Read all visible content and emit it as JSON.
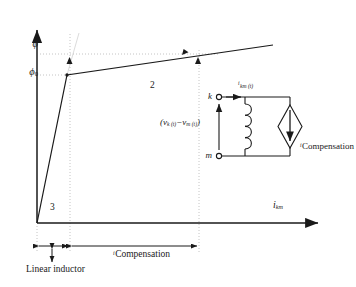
{
  "figure": {
    "type": "piecewise-linear-saturation-curve-with-equivalent-circuit",
    "axes": {
      "y_axis_name": "flux-linkage-axis",
      "x_axis_label": "i",
      "x_axis_label_sub": "km",
      "y_tick_labels": [
        {
          "name": "phi",
          "text": "ϕ",
          "sub": "",
          "y_px": 54
        },
        {
          "name": "phi-zero",
          "text": "ϕ",
          "sub": "0",
          "y_px": 75
        }
      ]
    },
    "curve": {
      "name": "saturation-characteristic",
      "knee_point_px": [
        67,
        75
      ],
      "origin_px": [
        37,
        223
      ],
      "end_px": [
        273,
        45
      ],
      "segments": [
        {
          "name": "steep-unsaturated-segment",
          "label": "3"
        },
        {
          "name": "shallow-saturated-segment",
          "label": "2"
        }
      ]
    },
    "region_labels": [
      {
        "name": "region-label-2",
        "text": "2"
      },
      {
        "name": "region-label-3",
        "text": "3"
      }
    ],
    "dimension_lines": [
      {
        "name": "linear-inductor-dimension",
        "label": "Linear inductor"
      },
      {
        "name": "compensation-current-dimension",
        "label_pre": "i",
        "label_sub": "Compensation"
      }
    ],
    "circuit": {
      "name": "equivalent-circuit-inset",
      "terminals": [
        {
          "name": "node-k-terminal",
          "label": "k"
        },
        {
          "name": "node-m-terminal",
          "label": "m"
        }
      ],
      "branch_current": {
        "label": "i",
        "sub": "km (t)"
      },
      "voltage_label": {
        "text": "(v",
        "sub1": "k (t)",
        "mid": "−v",
        "sub2": "m (t)",
        "close": ")"
      },
      "elements": [
        {
          "name": "inductor-coil",
          "type": "inductor"
        },
        {
          "name": "compensation-current-source",
          "type": "dependent-current-source",
          "label_pre": "i",
          "label_sub": "Compensation"
        }
      ]
    },
    "colors": {
      "line": "#1a1a1a",
      "dotted_guide": "#b8b8b8",
      "construction_guide": "#d8d8d8",
      "background": "#ffffff"
    }
  }
}
